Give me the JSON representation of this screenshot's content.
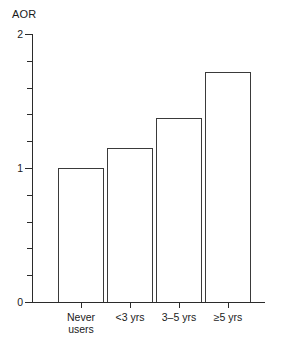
{
  "chart_data": {
    "type": "bar",
    "title": "",
    "ylabel": "AOR",
    "xlabel": "",
    "ylim": [
      0,
      2
    ],
    "grid": false,
    "legend": null,
    "categories": [
      "Never users",
      "<3 yrs",
      "3–5 yrs",
      "≥5 yrs"
    ],
    "values": [
      1.0,
      1.15,
      1.37,
      1.72
    ],
    "y_tick_labels": [
      "0",
      "1",
      "2"
    ],
    "y_major_ticks": [
      0,
      1,
      2
    ],
    "y_minor_tick_step": 0.2,
    "bar_style": {
      "fill": "#ffffff",
      "outline": "#3a3a3a"
    }
  },
  "axes": {
    "y_title": "AOR",
    "ticks": [
      {
        "value": 2,
        "label": "2",
        "major": true
      },
      {
        "value": 1.8,
        "label": "",
        "major": false
      },
      {
        "value": 1.6,
        "label": "",
        "major": false
      },
      {
        "value": 1.4,
        "label": "",
        "major": false
      },
      {
        "value": 1.2,
        "label": "",
        "major": false
      },
      {
        "value": 1,
        "label": "1",
        "major": true
      },
      {
        "value": 0.8,
        "label": "",
        "major": false
      },
      {
        "value": 0.6,
        "label": "",
        "major": false
      },
      {
        "value": 0.4,
        "label": "",
        "major": false
      },
      {
        "value": 0.2,
        "label": "",
        "major": false
      },
      {
        "value": 0,
        "label": "0",
        "major": true
      }
    ]
  },
  "bars": [
    {
      "label": "Never\nusers",
      "value": 1.0,
      "x": 58,
      "width": 46
    },
    {
      "label": "<3 yrs",
      "value": 1.15,
      "x": 107,
      "width": 46
    },
    {
      "label": "3–5 yrs",
      "value": 1.37,
      "x": 156,
      "width": 46
    },
    {
      "label": "≥5 yrs",
      "value": 1.72,
      "x": 205,
      "width": 46
    }
  ]
}
